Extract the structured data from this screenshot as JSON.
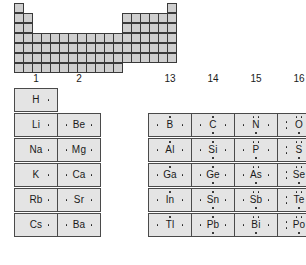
{
  "mini_table": {
    "name": "periodic-table-silhouette",
    "cell_color": "#cfcfcf",
    "rows": [
      [
        1,
        0,
        0,
        0,
        0,
        0,
        0,
        0,
        0,
        0,
        0,
        0,
        0,
        0,
        0,
        0,
        0,
        1
      ],
      [
        1,
        1,
        0,
        0,
        0,
        0,
        0,
        0,
        0,
        0,
        0,
        0,
        1,
        1,
        1,
        1,
        1,
        1
      ],
      [
        1,
        1,
        0,
        0,
        0,
        0,
        0,
        0,
        0,
        0,
        0,
        0,
        1,
        1,
        1,
        1,
        1,
        1
      ],
      [
        1,
        1,
        1,
        1,
        1,
        1,
        1,
        1,
        1,
        1,
        1,
        1,
        1,
        1,
        1,
        1,
        1,
        1
      ],
      [
        1,
        1,
        1,
        1,
        1,
        1,
        1,
        1,
        1,
        1,
        1,
        1,
        1,
        1,
        1,
        1,
        1,
        1
      ],
      [
        1,
        1,
        1,
        1,
        1,
        1,
        1,
        1,
        1,
        1,
        1,
        1,
        1,
        1,
        1,
        1,
        1,
        1
      ],
      [
        1,
        1,
        1,
        1,
        1,
        1,
        1,
        1,
        1,
        1,
        1,
        1,
        0,
        0,
        0,
        0,
        0,
        0
      ]
    ]
  },
  "group_numbers": [
    "1",
    "2",
    "13",
    "14",
    "15",
    "16",
    "17",
    "18"
  ],
  "chart_data": {
    "type": "table",
    "columns": [
      "1",
      "2",
      "13",
      "14",
      "15",
      "16",
      "17",
      "18"
    ],
    "valence_electrons_by_group": {
      "1": 1,
      "2": 2,
      "13": 3,
      "14": 4,
      "15": 5,
      "16": 6,
      "17": 7,
      "18": 8
    },
    "rows": [
      {
        "period": 1,
        "cells": [
          {
            "group": "1",
            "symbol": "H",
            "valence": 1
          },
          {
            "group": "18",
            "symbol": "He",
            "valence": 2
          }
        ]
      },
      {
        "period": 2,
        "cells": [
          {
            "group": "1",
            "symbol": "Li",
            "valence": 1
          },
          {
            "group": "2",
            "symbol": "Be",
            "valence": 2
          },
          {
            "group": "13",
            "symbol": "B",
            "valence": 3
          },
          {
            "group": "14",
            "symbol": "C",
            "valence": 4
          },
          {
            "group": "15",
            "symbol": "N",
            "valence": 5
          },
          {
            "group": "16",
            "symbol": "O",
            "valence": 6
          },
          {
            "group": "17",
            "symbol": "F",
            "valence": 7
          },
          {
            "group": "18",
            "symbol": "Ne",
            "valence": 8
          }
        ]
      },
      {
        "period": 3,
        "cells": [
          {
            "group": "1",
            "symbol": "Na",
            "valence": 1
          },
          {
            "group": "2",
            "symbol": "Mg",
            "valence": 2
          },
          {
            "group": "13",
            "symbol": "Al",
            "valence": 3
          },
          {
            "group": "14",
            "symbol": "Si",
            "valence": 4
          },
          {
            "group": "15",
            "symbol": "P",
            "valence": 5
          },
          {
            "group": "16",
            "symbol": "S",
            "valence": 6
          },
          {
            "group": "17",
            "symbol": "Cl",
            "valence": 7
          },
          {
            "group": "18",
            "symbol": "Ar",
            "valence": 8
          }
        ]
      },
      {
        "period": 4,
        "cells": [
          {
            "group": "1",
            "symbol": "K",
            "valence": 1
          },
          {
            "group": "2",
            "symbol": "Ca",
            "valence": 2
          },
          {
            "group": "13",
            "symbol": "Ga",
            "valence": 3
          },
          {
            "group": "14",
            "symbol": "Ge",
            "valence": 4
          },
          {
            "group": "15",
            "symbol": "As",
            "valence": 5
          },
          {
            "group": "16",
            "symbol": "Se",
            "valence": 6
          },
          {
            "group": "17",
            "symbol": "Br",
            "valence": 7
          },
          {
            "group": "18",
            "symbol": "Kr",
            "valence": 8
          }
        ]
      },
      {
        "period": 5,
        "cells": [
          {
            "group": "1",
            "symbol": "Rb",
            "valence": 1
          },
          {
            "group": "2",
            "symbol": "Sr",
            "valence": 2
          },
          {
            "group": "13",
            "symbol": "In",
            "valence": 3
          },
          {
            "group": "14",
            "symbol": "Sn",
            "valence": 4
          },
          {
            "group": "15",
            "symbol": "Sb",
            "valence": 5
          },
          {
            "group": "16",
            "symbol": "Te",
            "valence": 6
          },
          {
            "group": "17",
            "symbol": "I",
            "valence": 7
          },
          {
            "group": "18",
            "symbol": "Xe",
            "valence": 8
          }
        ]
      },
      {
        "period": 6,
        "cells": [
          {
            "group": "1",
            "symbol": "Cs",
            "valence": 1
          },
          {
            "group": "2",
            "symbol": "Ba",
            "valence": 2
          },
          {
            "group": "13",
            "symbol": "Tl",
            "valence": 3
          },
          {
            "group": "14",
            "symbol": "Pb",
            "valence": 4
          },
          {
            "group": "15",
            "symbol": "Bi",
            "valence": 5
          },
          {
            "group": "16",
            "symbol": "Po",
            "valence": 6
          },
          {
            "group": "17",
            "symbol": "At",
            "valence": 7
          },
          {
            "group": "18",
            "symbol": "Rn",
            "valence": 8
          }
        ]
      }
    ]
  },
  "colors": {
    "cell_fill": "#e4e4e4",
    "cell_border": "#4a4a4a",
    "mini_fill": "#cfcfcf",
    "text": "#1a1a1a",
    "background": "#ffffff"
  },
  "layout": {
    "group_x": {
      "1": 14,
      "2": 57,
      "13": 148,
      "14": 191,
      "15": 234,
      "16": 277,
      "17": 320,
      "18": 363
    },
    "cell_width": 44,
    "cell_height": 24,
    "grid_top": 88
  }
}
